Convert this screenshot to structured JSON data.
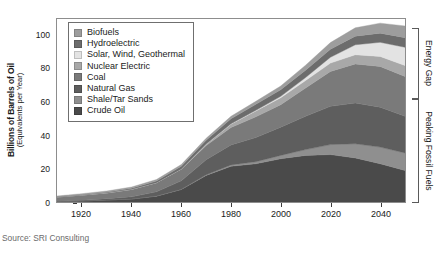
{
  "chart_data": {
    "type": "area",
    "stacked": true,
    "title": "",
    "xlabel": "",
    "ylabel": "Billions of Barrels of Oil (Equivalents per Year)",
    "ylabel_main": "Billions of Barrels of Oil",
    "ylabel_sub": "(Equivalents per Year)",
    "xlim": [
      1910,
      2050
    ],
    "ylim": [
      0,
      110
    ],
    "xticks": [
      1920,
      1940,
      1960,
      1980,
      2000,
      2020,
      2040
    ],
    "yticks": [
      0,
      20,
      40,
      60,
      80,
      100
    ],
    "grid": false,
    "legend_position": "upper-left-inside",
    "x": [
      1910,
      1920,
      1930,
      1940,
      1950,
      1960,
      1970,
      1980,
      1990,
      2000,
      2010,
      2020,
      2030,
      2040,
      2050
    ],
    "series": [
      {
        "name": "Crude Oil",
        "color": "#4a4a4a",
        "values": [
          0.3,
          0.6,
          1.2,
          1.8,
          3.5,
          7.5,
          16.0,
          21.5,
          23.0,
          26.0,
          28.0,
          28.5,
          26.5,
          23.0,
          19.0
        ]
      },
      {
        "name": "Shale/Tar Sands",
        "color": "#8f8f8f",
        "values": [
          0.0,
          0.0,
          0.0,
          0.0,
          0.1,
          0.2,
          0.4,
          0.8,
          1.2,
          2.0,
          3.5,
          6.0,
          8.5,
          10.0,
          10.5
        ]
      },
      {
        "name": "Natural Gas",
        "color": "#5e5e5e",
        "values": [
          0.2,
          0.4,
          0.8,
          1.3,
          2.5,
          5.0,
          9.0,
          12.0,
          14.5,
          17.0,
          20.0,
          23.0,
          24.5,
          24.0,
          22.0
        ]
      },
      {
        "name": "Coal",
        "color": "#7a7a7a",
        "values": [
          2.5,
          3.2,
          3.5,
          4.5,
          5.5,
          7.0,
          8.5,
          10.5,
          12.5,
          13.5,
          17.0,
          21.0,
          23.5,
          24.5,
          24.0
        ]
      },
      {
        "name": "Nuclear Electric",
        "color": "#a8a8a8",
        "values": [
          0.0,
          0.0,
          0.0,
          0.0,
          0.0,
          0.2,
          0.8,
          2.0,
          3.5,
          4.2,
          4.5,
          5.0,
          5.5,
          6.0,
          6.5
        ]
      },
      {
        "name": "Solar, Wind, Geothermal",
        "color": "#e3e3e3",
        "values": [
          0.0,
          0.0,
          0.0,
          0.0,
          0.0,
          0.0,
          0.1,
          0.2,
          0.4,
          0.8,
          1.8,
          3.5,
          6.0,
          8.5,
          11.0
        ]
      },
      {
        "name": "Hydroelectric",
        "color": "#6c6c6c",
        "values": [
          0.1,
          0.2,
          0.4,
          0.6,
          1.0,
          1.6,
          2.3,
          3.0,
          3.6,
          4.0,
          4.4,
          4.8,
          5.2,
          5.5,
          5.8
        ]
      },
      {
        "name": "Biofuels",
        "color": "#9d9d9d",
        "values": [
          0.5,
          0.6,
          0.7,
          0.8,
          0.9,
          1.0,
          1.2,
          1.5,
          1.8,
          2.2,
          3.0,
          4.0,
          5.0,
          6.0,
          7.0
        ]
      }
    ],
    "annotations": [
      {
        "label": "Energy Gap",
        "position": "right",
        "span_top_value": 104,
        "span_bottom_value": 62
      },
      {
        "label": "Peaking Fossil Fuels",
        "position": "right",
        "span_top_value": 62,
        "span_bottom_value": 0
      }
    ]
  },
  "legend": {
    "items": [
      {
        "label": "Biofuels",
        "color": "#9d9d9d"
      },
      {
        "label": "Hydroelectric",
        "color": "#6c6c6c"
      },
      {
        "label": "Solar, Wind, Geothermal",
        "color": "#e3e3e3"
      },
      {
        "label": "Nuclear Electric",
        "color": "#a8a8a8"
      },
      {
        "label": "Coal",
        "color": "#7a7a7a"
      },
      {
        "label": "Natural Gas",
        "color": "#5e5e5e"
      },
      {
        "label": "Shale/Tar Sands",
        "color": "#8f8f8f"
      },
      {
        "label": "Crude Oil",
        "color": "#4a4a4a"
      }
    ]
  },
  "source": {
    "text": "Source: SRI Consulting"
  }
}
